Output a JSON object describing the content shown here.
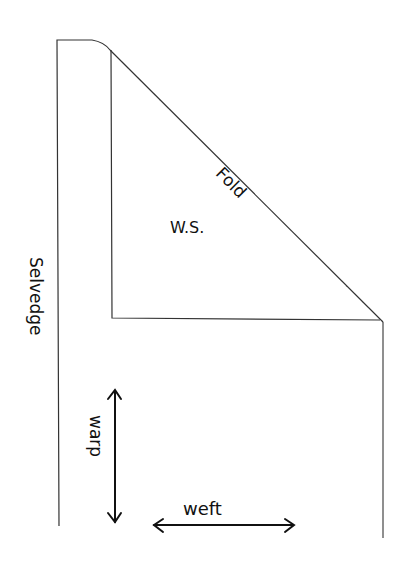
{
  "diagram": {
    "labels": {
      "fold": "Fold",
      "wrong_side": "W.S.",
      "selvedge": "Selvedge",
      "warp": "warp",
      "weft": "weft"
    },
    "colors": {
      "line": "#222222",
      "stipple": "#333333",
      "background": "#ffffff"
    }
  }
}
